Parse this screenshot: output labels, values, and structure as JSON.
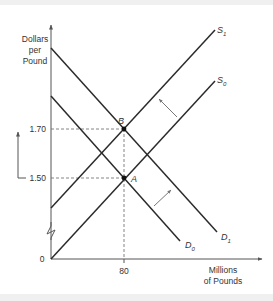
{
  "diagram": {
    "type": "supply-demand",
    "y_axis_label": [
      "Dollars",
      "per",
      "Pound"
    ],
    "x_axis_label": [
      "Millions",
      "of Pounds"
    ],
    "origin_label": "0",
    "y_ticks": [
      {
        "label": "1.70",
        "value": 1.7
      },
      {
        "label": "1.50",
        "value": 1.5
      }
    ],
    "x_ticks": [
      {
        "label": "80",
        "value": 80
      }
    ],
    "curves": [
      {
        "name": "S",
        "subscript": "0",
        "kind": "supply"
      },
      {
        "name": "S",
        "subscript": "1",
        "kind": "supply"
      },
      {
        "name": "D",
        "subscript": "0",
        "kind": "demand"
      },
      {
        "name": "D",
        "subscript": "1",
        "kind": "demand"
      }
    ],
    "points": [
      {
        "label": "A",
        "price": 1.5,
        "quantity": 80,
        "curves": [
          "S0",
          "D0"
        ]
      },
      {
        "label": "B",
        "price": 1.7,
        "quantity": 80,
        "curves": [
          "S1",
          "D1"
        ]
      }
    ],
    "shifts": [
      {
        "from": "S0",
        "to": "S1",
        "direction": "left/up"
      },
      {
        "from": "D0",
        "to": "D1",
        "direction": "right/up"
      }
    ],
    "price_change_indicator": "up from 1.50 to 1.70",
    "colors": {
      "line": "#2b2b2b",
      "axis": "#555555",
      "guide": "#666666",
      "arrow": "#777777"
    }
  }
}
